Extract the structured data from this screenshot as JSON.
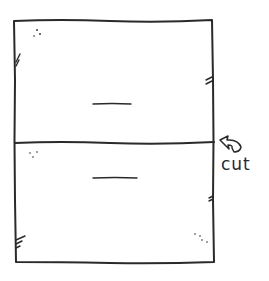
{
  "diagram": {
    "type": "hand-drawn sketch",
    "ink_color": "#2a2a2a",
    "background_color": "#ffffff",
    "panels": [
      {
        "name": "top-half",
        "center_mark": "—"
      },
      {
        "name": "bottom-half",
        "center_mark": "—"
      }
    ],
    "annotation": {
      "label": "cut",
      "arrow": "curved-arrow pointing to dividing line"
    }
  }
}
